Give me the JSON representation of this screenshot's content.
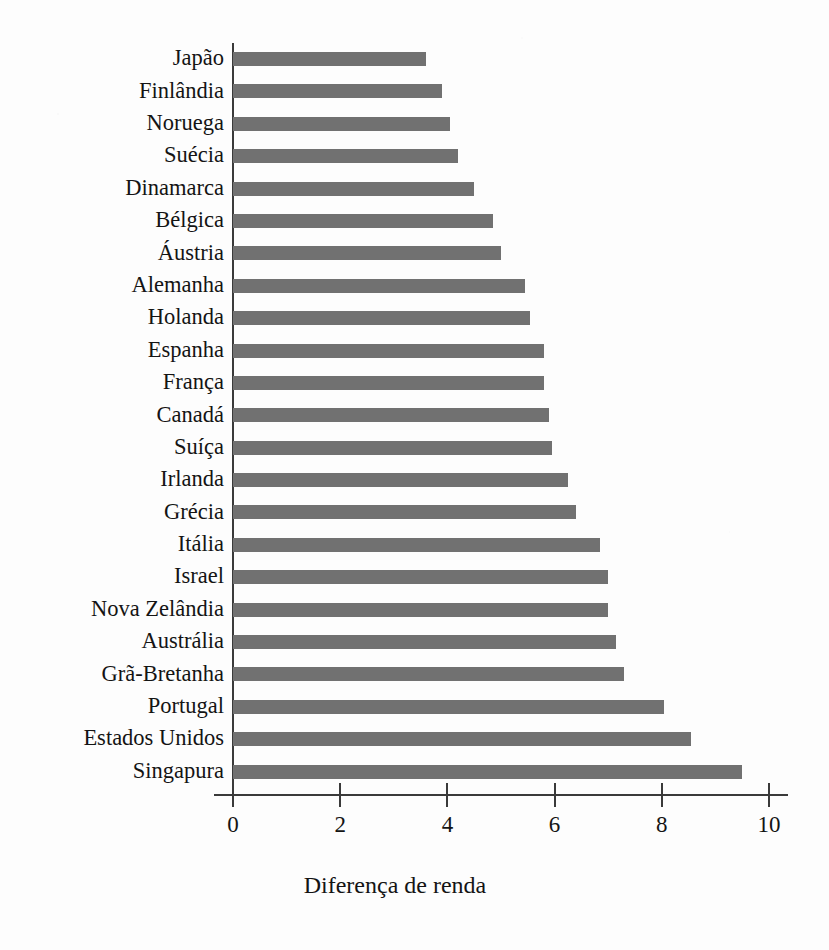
{
  "chart_data": {
    "type": "bar",
    "orientation": "horizontal",
    "title": "",
    "xlabel": "Diferença de renda",
    "ylabel": "",
    "xlim": [
      0,
      10
    ],
    "xticks": [
      0,
      2,
      4,
      6,
      8,
      10
    ],
    "xtick_labels": [
      "0",
      "2",
      "4",
      "6",
      "8",
      "10"
    ],
    "grid": false,
    "legend": null,
    "bar_color": "#717171",
    "axis_color": "#3a3a3a",
    "background_color": "#fdfdfd",
    "categories": [
      "Japão",
      "Finlândia",
      "Noruega",
      "Suécia",
      "Dinamarca",
      "Bélgica",
      "Áustria",
      "Alemanha",
      "Holanda",
      "Espanha",
      "França",
      "Canadá",
      "Suíça",
      "Irlanda",
      "Grécia",
      "Itália",
      "Israel",
      "Nova Zelândia",
      "Austrália",
      "Grã-Bretanha",
      "Portugal",
      "Estados Unidos",
      "Singapura"
    ],
    "values": [
      3.6,
      3.9,
      4.05,
      4.2,
      4.5,
      4.85,
      5.0,
      5.45,
      5.55,
      5.8,
      5.8,
      5.9,
      5.95,
      6.25,
      6.4,
      6.85,
      7.0,
      7.0,
      7.15,
      7.3,
      8.05,
      8.55,
      9.5
    ]
  }
}
